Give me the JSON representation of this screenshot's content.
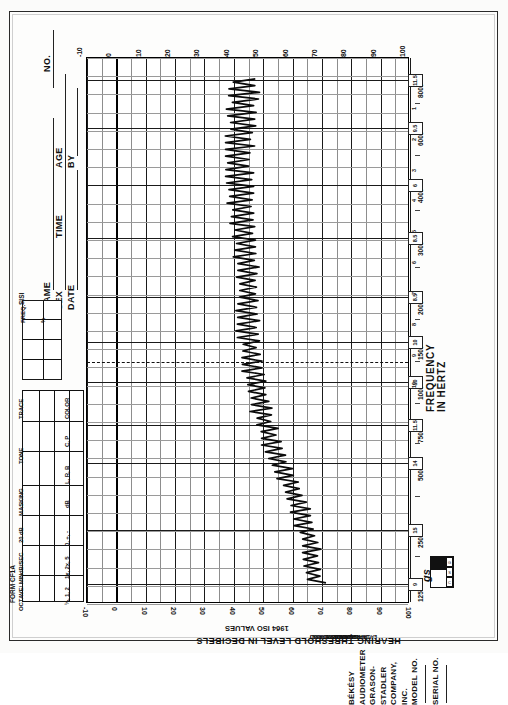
{
  "form": {
    "form_number": "FORM CF1A",
    "brand_line1": "BÉKÉSY AUDIOMETER",
    "brand_line2": "GRASON-STADLER COMPANY, INC.",
    "model_label": "MODEL NO.",
    "serial_label": "SERIAL NO.",
    "logo_mark": "gs",
    "logo_sub": [
      "G",
      "S",
      "C"
    ]
  },
  "patient_fields": [
    {
      "label": "NAME"
    },
    {
      "label": "SEX"
    },
    {
      "label": "DATE"
    },
    {
      "label": "NO."
    },
    {
      "label": "AGE"
    },
    {
      "label": "BY"
    },
    {
      "label": "TIME"
    }
  ],
  "sisi_table": {
    "title": "SISI",
    "columns": [
      "FREQ.",
      "%"
    ],
    "rows": 3
  },
  "trace_table": {
    "headers": [
      "TRACE",
      "TONE",
      "MASKING",
      "20 dB",
      "dB/SEC",
      "OCTAVE/\nMIN"
    ],
    "subheaders": [
      "COLOR",
      "C, P",
      "L, R, B",
      "dB",
      "0, +, -",
      "1x, 2x, 5",
      "¼, 1, 2"
    ],
    "rows": 3
  },
  "axes": {
    "y_title": "HEARING THRESHOLD LEVEL IN DECIBELS",
    "y_subtitle": "1964 ISO VALUES",
    "x_title": "FREQUENCY IN HERTZ",
    "db_ticks": [
      "-10",
      "0",
      "10",
      "20",
      "30",
      "40",
      "50",
      "60",
      "70",
      "80",
      "90",
      "100"
    ],
    "frequency_ticks": [
      "125",
      "250",
      "500",
      "750",
      "1000",
      "1500",
      "2000",
      "3000",
      "4000",
      "6000",
      "8000"
    ],
    "octave_numbers": [
      "1",
      "2",
      "3",
      "4",
      "5",
      "6",
      "7",
      "8",
      "9",
      "10"
    ]
  },
  "iso_asa": {
    "note": "TO CONVERT ISO READINGS TO ASA READINGS SUBTRACT APPROPRIATE \"DIFFERENCE IN dB\" AT EACH FREQUENCY.",
    "corrections": [
      {
        "freq": "125",
        "value": "9"
      },
      {
        "freq": "250",
        "value": "15"
      },
      {
        "freq": "500",
        "value": "14"
      },
      {
        "freq": "750",
        "value": "11.5"
      },
      {
        "freq": "1000",
        "value": "10"
      },
      {
        "freq": "1500",
        "value": "10"
      },
      {
        "freq": "2000",
        "value": "8.5"
      },
      {
        "freq": "3000",
        "value": "8.5"
      },
      {
        "freq": "4000",
        "value": "6"
      },
      {
        "freq": "6000",
        "value": "9.5"
      },
      {
        "freq": "8000",
        "value": "11.5"
      }
    ]
  },
  "chart_data": {
    "type": "line",
    "xlabel": "HEARING THRESHOLD LEVEL IN DECIBELS",
    "ylabel": "FREQUENCY IN HERTZ",
    "xlim": [
      -10,
      100
    ],
    "ylim_freq": [
      125,
      8000
    ],
    "grid": true,
    "legend": "none",
    "orientation": "frequency-vertical (form rotated 90°)",
    "series": [
      {
        "name": "continuous-tone-tracing",
        "description": "Békésy zig-zag excursion trace; midline threshold in dB HL plotted against frequency",
        "frequency_hz": [
          125,
          180,
          250,
          350,
          500,
          700,
          1000,
          1400,
          2000,
          2800,
          4000,
          5600,
          8000
        ],
        "threshold_db": [
          44,
          43,
          42,
          43,
          44,
          45,
          45,
          47,
          50,
          55,
          62,
          66,
          68
        ],
        "excursion_db": [
          9,
          9,
          8,
          8,
          7,
          7,
          6,
          6,
          6,
          6,
          6,
          6,
          6
        ]
      }
    ],
    "reference_line": {
      "label": "dashed reference",
      "db": null,
      "at_frequency_hz": 750,
      "style": "dashed"
    }
  }
}
